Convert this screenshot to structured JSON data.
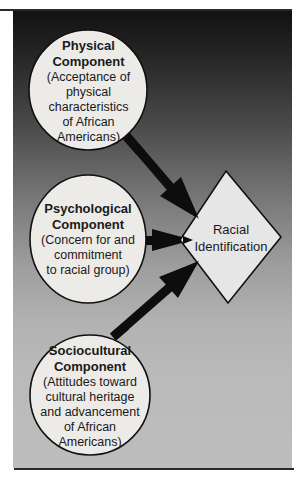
{
  "diagram": {
    "type": "flow",
    "direction": "converging arrows into central diamond",
    "colors": {
      "panel_top": "#121212",
      "panel_mid": "#7a7a7a",
      "panel_bottom": "#bdbdbd",
      "node_fill": "#ecebe8",
      "target_fill": "#e6e6e6",
      "stroke": "#111111",
      "arrow": "#0d0d0d"
    },
    "nodes": [
      {
        "id": "physical",
        "shape": "circle",
        "title_line1": "Physical",
        "title_line2": "Component",
        "description": "(Acceptance of\nphysical\ncharacteristics\nof African\nAmericans)"
      },
      {
        "id": "psychological",
        "shape": "circle",
        "title_line1": "Psychological",
        "title_line2": "Component",
        "description": "(Concern for and\ncommitment\nto racial group)"
      },
      {
        "id": "sociocultural",
        "shape": "circle",
        "title_line1": "Sociocultural",
        "title_line2": "Component",
        "description": "(Attitudes toward\ncultural heritage\nand advancement\nof African\nAmericans)"
      }
    ],
    "target": {
      "id": "racial-identification",
      "shape": "diamond",
      "label": "Racial\nIdentification"
    },
    "edges": [
      {
        "from": "physical",
        "to": "racial-identification"
      },
      {
        "from": "psychological",
        "to": "racial-identification"
      },
      {
        "from": "sociocultural",
        "to": "racial-identification"
      }
    ]
  }
}
